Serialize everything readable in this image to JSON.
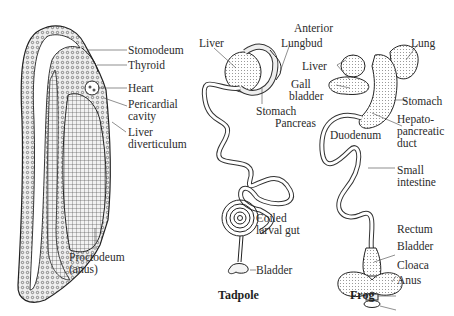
{
  "figure": {
    "panels": [
      {
        "id": "embryo",
        "caption": "",
        "labels": {
          "stomodeum": "Stomodeum",
          "thyroid": "Thyroid",
          "heart": "Heart",
          "pericardial_1": "Pericardial",
          "pericardial_2": "cavity",
          "liver_div_1": "Liver",
          "liver_div_2": "diverticulum",
          "proctodeum_1": "Proctodeum",
          "proctodeum_2": "(anus)"
        }
      },
      {
        "id": "tadpole",
        "caption": "Tadpole",
        "labels": {
          "liver": "Liver",
          "anterior": "Anterior",
          "lungbud": "Lungbud",
          "stomach": "Stomach",
          "pancreas": "Pancreas",
          "coiled_1": "Coiled",
          "coiled_2": "larval gut",
          "bladder": "Bladder"
        }
      },
      {
        "id": "frog",
        "caption": "Frog",
        "labels": {
          "lung": "Lung",
          "liver": "Liver",
          "gall_1": "Gall",
          "gall_2": "bladder",
          "stomach": "Stomach",
          "duodenum": "Duodenum",
          "hepato_1": "Hepato-",
          "hepato_2": "pancreatic",
          "hepato_3": "duct",
          "small_int_1": "Small",
          "small_int_2": "intestine",
          "rectum": "Rectum",
          "bladder": "Bladder",
          "cloaca": "Cloaca",
          "anus": "Anus"
        }
      }
    ]
  }
}
